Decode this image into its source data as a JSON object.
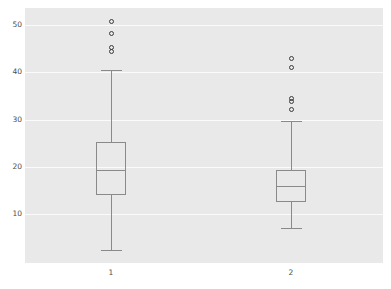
{
  "chart_data": {
    "type": "box",
    "title": "",
    "xlabel": "",
    "ylabel": "",
    "categories": [
      "1",
      "2"
    ],
    "xtick_labels": [
      "1",
      "2"
    ],
    "ytick_labels": [
      "10",
      "20",
      "30",
      "40",
      "50"
    ],
    "ytick_values": [
      10,
      20,
      30,
      40,
      50
    ],
    "ylim": [
      -0.9,
      54
    ],
    "grid": "horizontal-only",
    "legend": "none",
    "panel_background": "#e9e9e9",
    "gridline_color": "#fbfbfb",
    "box_line_color": "#8a8a8a",
    "outlier_color": "#3a3a3a",
    "boxes": [
      {
        "category": "1",
        "whisker_low": 2.4,
        "q1": 14.1,
        "median": 19.3,
        "q3": 25.3,
        "whisker_high": 40.4,
        "outliers": [
          44.3,
          45.3,
          48.3,
          50.8
        ]
      },
      {
        "category": "2",
        "whisker_low": 7.1,
        "q1": 12.6,
        "median": 15.9,
        "q3": 19.3,
        "whisker_high": 29.6,
        "outliers": [
          32.1,
          33.8,
          34.4,
          41.0,
          42.9
        ]
      }
    ]
  }
}
